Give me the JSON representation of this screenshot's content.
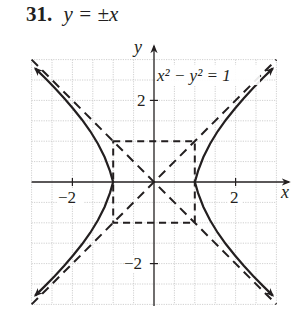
{
  "problem": {
    "number": "31.",
    "answer": "y = ±x"
  },
  "graph": {
    "equation_label": "x² − y² = 1",
    "x_axis_label": "x",
    "y_axis_label": "y",
    "x_tick_labels": [
      "−2",
      "2"
    ],
    "y_tick_labels": [
      "2",
      "−2"
    ],
    "grid_range": {
      "x": [
        -3,
        3
      ],
      "y": [
        -3,
        3
      ],
      "minor_step": 0.5
    },
    "asymptotes": [
      "y = x",
      "y = -x"
    ],
    "fundamental_rectangle": {
      "x": [
        -1,
        1
      ],
      "y": [
        -1,
        1
      ]
    },
    "vertices": [
      [
        -1,
        0
      ],
      [
        1,
        0
      ]
    ],
    "curve_color": "#231f20",
    "grid_color": "#bdbdbd"
  }
}
